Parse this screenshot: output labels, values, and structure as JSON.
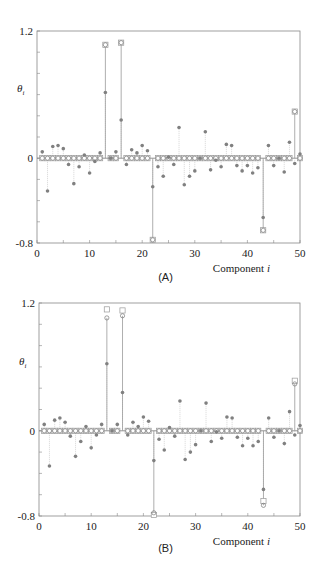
{
  "figure": {
    "panels": [
      {
        "label": "(A)",
        "xlabel": "Component i",
        "ylabel": "θi"
      },
      {
        "label": "(B)",
        "xlabel": "Component i",
        "ylabel": "θi"
      }
    ],
    "colors": {
      "axis": "#888888",
      "marker": "#808080",
      "true_marker": "#999999",
      "text": "#222222"
    }
  },
  "chart_data": [
    {
      "type": "scatter",
      "title": "(A)",
      "xlabel": "Component i",
      "ylabel": "θi",
      "xlim": [
        0,
        50
      ],
      "ylim": [
        -0.8,
        1.2
      ],
      "xticks": [
        0,
        10,
        20,
        30,
        40,
        50
      ],
      "yticks": [
        -0.8,
        0,
        1.2
      ],
      "grid": false,
      "x": [
        1,
        2,
        3,
        4,
        5,
        6,
        7,
        8,
        9,
        10,
        11,
        12,
        13,
        14,
        15,
        16,
        17,
        18,
        19,
        20,
        21,
        22,
        23,
        24,
        25,
        26,
        27,
        28,
        29,
        30,
        31,
        32,
        33,
        34,
        35,
        36,
        37,
        38,
        39,
        40,
        41,
        42,
        43,
        44,
        45,
        46,
        47,
        48,
        49,
        50
      ],
      "series": [
        {
          "name": "true θ (squares)",
          "values": [
            0,
            0,
            0,
            0,
            0,
            0,
            0,
            0,
            0,
            0,
            0,
            0,
            1.07,
            0,
            0,
            1.09,
            0,
            0,
            0,
            0,
            0,
            -0.77,
            0,
            0,
            0,
            0,
            0,
            0,
            0,
            0,
            0,
            0,
            0,
            0,
            0,
            0,
            0,
            0,
            0,
            0,
            0,
            0,
            -0.68,
            0,
            0,
            0,
            0,
            0,
            0.44,
            0
          ]
        },
        {
          "name": "estimate (circles)",
          "values": [
            0,
            0,
            0,
            0,
            0,
            0,
            0,
            0,
            0,
            0,
            0,
            0,
            1.07,
            0,
            0,
            1.09,
            0,
            0,
            0,
            0,
            0,
            -0.77,
            0,
            0,
            0,
            0,
            0,
            0,
            0,
            0,
            0,
            0,
            0,
            0,
            0,
            0,
            0,
            0,
            0,
            0,
            0,
            0,
            -0.68,
            0,
            0,
            0,
            0,
            0,
            0.44,
            0
          ]
        },
        {
          "name": "observation (stars)",
          "values": [
            0.06,
            -0.31,
            0.11,
            0.12,
            0.09,
            -0.06,
            -0.24,
            -0.08,
            0.03,
            -0.14,
            -0.03,
            0.05,
            0.62,
            0.0,
            0.06,
            0.36,
            -0.06,
            0.08,
            0.05,
            0.12,
            0.07,
            -0.27,
            -0.08,
            -0.17,
            0.01,
            -0.06,
            0.29,
            -0.25,
            -0.17,
            -0.12,
            0.0,
            0.25,
            -0.11,
            -0.02,
            -0.08,
            0.13,
            0.12,
            -0.07,
            -0.12,
            -0.07,
            -0.14,
            -0.09,
            -0.56,
            0.12,
            -0.07,
            0.0,
            -0.13,
            0.15,
            -0.05,
            0.04
          ]
        }
      ]
    },
    {
      "type": "scatter",
      "title": "(B)",
      "xlabel": "Component i",
      "ylabel": "θi",
      "xlim": [
        0,
        50
      ],
      "ylim": [
        -0.8,
        1.2
      ],
      "xticks": [
        0,
        10,
        20,
        30,
        40,
        50
      ],
      "yticks": [
        -0.8,
        0,
        1.2
      ],
      "grid": false,
      "x": [
        1,
        2,
        3,
        4,
        5,
        6,
        7,
        8,
        9,
        10,
        11,
        12,
        13,
        14,
        15,
        16,
        17,
        18,
        19,
        20,
        21,
        22,
        23,
        24,
        25,
        26,
        27,
        28,
        29,
        30,
        31,
        32,
        33,
        34,
        35,
        36,
        37,
        38,
        39,
        40,
        41,
        42,
        43,
        44,
        45,
        46,
        47,
        48,
        49,
        50
      ],
      "series": [
        {
          "name": "true θ (squares)",
          "values": [
            0,
            0,
            0,
            0,
            0,
            0,
            0,
            0,
            0,
            0,
            0,
            0,
            1.14,
            0,
            0,
            1.13,
            0,
            0,
            0,
            0,
            0,
            -0.79,
            0,
            0,
            0,
            0,
            0,
            0,
            0,
            0,
            0,
            0,
            0,
            0,
            0,
            0,
            0,
            0,
            0,
            0,
            0,
            0,
            -0.66,
            0,
            0,
            0,
            0,
            0,
            0.47,
            0
          ]
        },
        {
          "name": "estimate (circles)",
          "values": [
            0,
            0,
            0,
            0,
            0,
            0,
            0,
            0,
            0,
            0,
            0,
            0,
            1.06,
            0,
            0,
            1.08,
            0,
            0,
            0,
            0,
            0,
            -0.77,
            0,
            0,
            0,
            0,
            0,
            0,
            0,
            0,
            0,
            0,
            0,
            0,
            0,
            0,
            0,
            0,
            0,
            0,
            0,
            0,
            -0.7,
            0,
            0,
            0,
            0,
            0,
            0.44,
            0
          ]
        },
        {
          "name": "observation (stars)",
          "values": [
            0.06,
            -0.33,
            0.1,
            0.12,
            0.08,
            -0.05,
            -0.24,
            -0.1,
            0.04,
            -0.16,
            -0.04,
            0.06,
            0.63,
            0.0,
            0.06,
            0.36,
            -0.04,
            0.08,
            0.04,
            0.13,
            0.09,
            -0.28,
            -0.08,
            -0.18,
            0.03,
            -0.05,
            0.28,
            -0.27,
            -0.2,
            -0.13,
            0.0,
            0.26,
            -0.1,
            -0.01,
            -0.07,
            0.13,
            0.12,
            -0.06,
            -0.14,
            -0.07,
            -0.14,
            -0.1,
            -0.55,
            0.12,
            -0.06,
            0.0,
            -0.12,
            0.18,
            -0.04,
            0.05
          ]
        }
      ]
    }
  ]
}
